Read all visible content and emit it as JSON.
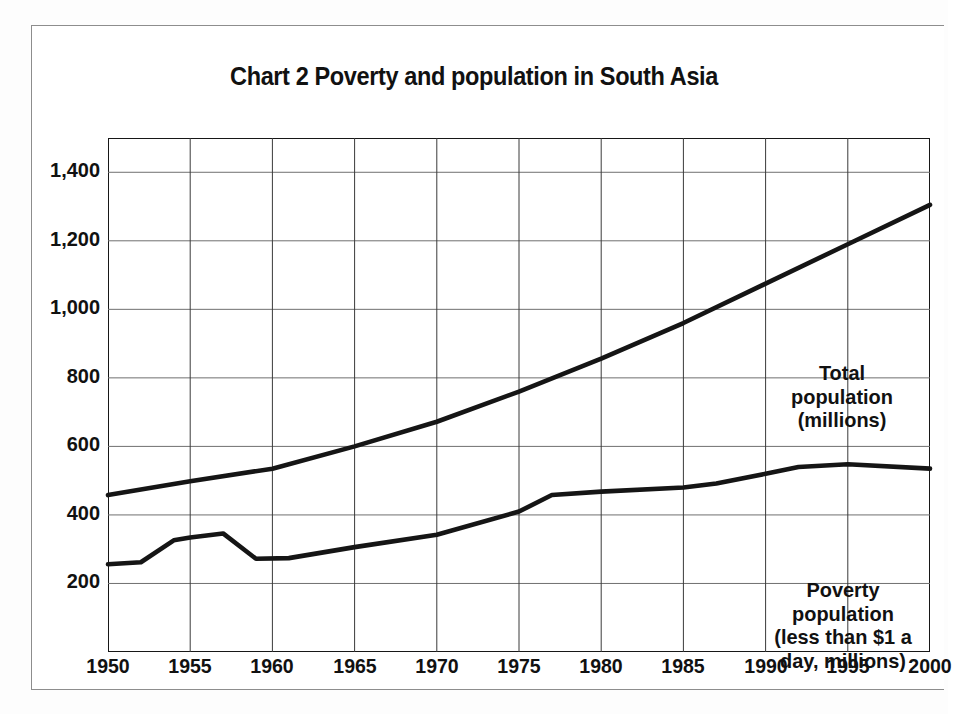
{
  "title": "Chart 2 Poverty and population in South Asia",
  "axes": {
    "y_ticks": [
      "1,400",
      "1,200",
      "1,000",
      "800",
      "600",
      "400",
      "200"
    ],
    "x_ticks": [
      "1950",
      "1955",
      "1960",
      "1965",
      "1970",
      "1975",
      "1980",
      "1985",
      "1990",
      "1995",
      "2000"
    ]
  },
  "annotations": {
    "total": [
      "Total",
      "population",
      "(millions)"
    ],
    "poverty": [
      "Poverty",
      "population",
      "(less than $1 a",
      "day, millions)"
    ]
  },
  "chart_data": {
    "type": "line",
    "title": "Chart 2 Poverty and population in South Asia",
    "xlabel": "",
    "ylabel": "",
    "xlim": [
      1950,
      2000
    ],
    "ylim": [
      0,
      1500
    ],
    "yticks": [
      200,
      400,
      600,
      800,
      1000,
      1200,
      1400
    ],
    "xticks": [
      1950,
      1955,
      1960,
      1965,
      1970,
      1975,
      1980,
      1985,
      1990,
      1995,
      2000
    ],
    "grid": true,
    "legend": "in-plot annotations",
    "series": [
      {
        "name": "Total population (millions)",
        "color": "#151515",
        "x": [
          1950,
          1955,
          1960,
          1965,
          1970,
          1975,
          1980,
          1985,
          1990,
          1995,
          2000
        ],
        "values": [
          458,
          498,
          535,
          600,
          672,
          760,
          856,
          960,
          1075,
          1190,
          1305
        ]
      },
      {
        "name": "Poverty population (less than $1 a day, millions)",
        "color": "#151515",
        "x": [
          1950,
          1952,
          1954,
          1955,
          1957,
          1959,
          1961,
          1965,
          1970,
          1975,
          1977,
          1980,
          1985,
          1987,
          1990,
          1992,
          1995,
          2000
        ],
        "values": [
          256,
          262,
          326,
          334,
          346,
          272,
          274,
          306,
          342,
          410,
          458,
          468,
          480,
          492,
          520,
          540,
          548,
          535
        ]
      }
    ]
  }
}
